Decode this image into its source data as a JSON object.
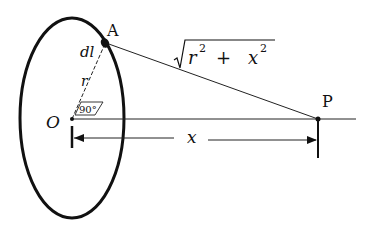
{
  "diagram": {
    "points": {
      "A": "A",
      "O": "O",
      "P": "P"
    },
    "labels": {
      "element": "dl",
      "radius": "r",
      "angle": "90°",
      "distance_base": "r",
      "distance_plus": "+",
      "distance_x": "x",
      "sup2": "2",
      "axis_distance": "x"
    },
    "colors": {
      "ink": "#111111",
      "background": "#ffffff"
    }
  }
}
